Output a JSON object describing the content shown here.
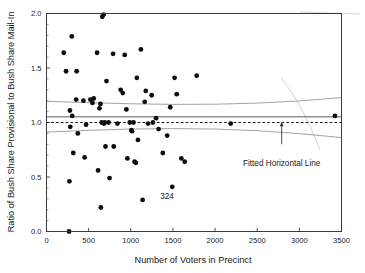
{
  "chart_data": {
    "type": "scatter",
    "title": "",
    "xlabel": "Number of Voters in Precinct",
    "ylabel": "Ratio of Bush Share Provisional to Bush Share Mail-In",
    "xlim": [
      0,
      3500
    ],
    "ylim": [
      0.0,
      2.0
    ],
    "xticks": [
      0,
      500,
      1000,
      1500,
      2000,
      2500,
      3000,
      3500
    ],
    "xtick_labels": [
      "0",
      "500",
      "1000",
      "1500",
      "2000",
      "2500",
      "3000",
      "3500"
    ],
    "yticks": [
      0.0,
      0.5,
      1.0,
      1.5,
      2.0
    ],
    "ytick_labels": [
      "0.0",
      "0.5",
      "1.0",
      "1.5",
      "2.0"
    ],
    "y_minor_ticks": [
      0.1,
      0.2,
      0.3,
      0.4,
      0.6,
      0.7,
      0.8,
      0.9,
      1.1,
      1.2,
      1.3,
      1.4,
      1.6,
      1.7,
      1.8,
      1.9
    ],
    "grid": false,
    "legend": false,
    "marker": "filled-circle",
    "marker_color": "#0d0d0d",
    "marker_size": 4.4,
    "points": [
      [
        205,
        1.64
      ],
      [
        232,
        1.47
      ],
      [
        268,
        0.0
      ],
      [
        272,
        0.46
      ],
      [
        278,
        1.11
      ],
      [
        282,
        0.96
      ],
      [
        300,
        1.79
      ],
      [
        305,
        1.06
      ],
      [
        318,
        0.72
      ],
      [
        352,
        1.21
      ],
      [
        358,
        1.47
      ],
      [
        372,
        0.9
      ],
      [
        438,
        1.2
      ],
      [
        452,
        0.68
      ],
      [
        470,
        0.98
      ],
      [
        520,
        1.21
      ],
      [
        545,
        1.18
      ],
      [
        560,
        1.22
      ],
      [
        600,
        1.64
      ],
      [
        612,
        0.56
      ],
      [
        628,
        1.13
      ],
      [
        640,
        1.17
      ],
      [
        645,
        0.22
      ],
      [
        655,
        1.0
      ],
      [
        662,
        1.97
      ],
      [
        678,
        1.99
      ],
      [
        682,
        0.99
      ],
      [
        690,
        1.0
      ],
      [
        700,
        0.78
      ],
      [
        712,
        1.38
      ],
      [
        736,
        1.0
      ],
      [
        748,
        0.49
      ],
      [
        790,
        1.63
      ],
      [
        798,
        0.78
      ],
      [
        842,
        0.99
      ],
      [
        880,
        1.3
      ],
      [
        905,
        1.27
      ],
      [
        928,
        1.62
      ],
      [
        948,
        1.12
      ],
      [
        960,
        0.67
      ],
      [
        988,
        1.0
      ],
      [
        1008,
        0.93
      ],
      [
        1015,
        0.92
      ],
      [
        1032,
        1.0
      ],
      [
        1045,
        0.64
      ],
      [
        1060,
        0.63
      ],
      [
        1072,
        1.41
      ],
      [
        1085,
        0.84
      ],
      [
        1120,
        1.67
      ],
      [
        1140,
        0.29
      ],
      [
        1165,
        1.19
      ],
      [
        1178,
        1.29
      ],
      [
        1205,
        0.99
      ],
      [
        1248,
        1.25
      ],
      [
        1262,
        1.0
      ],
      [
        1300,
        1.04
      ],
      [
        1330,
        0.94
      ],
      [
        1380,
        0.72
      ],
      [
        1432,
        0.88
      ],
      [
        1468,
        1.14
      ],
      [
        1492,
        0.41
      ],
      [
        1520,
        1.41
      ],
      [
        1545,
        1.26
      ],
      [
        1600,
        0.67
      ],
      [
        1640,
        0.64
      ],
      [
        1782,
        1.43
      ],
      [
        2185,
        0.99
      ],
      [
        3422,
        1.06
      ]
    ],
    "point_annotations": [
      {
        "label": "324",
        "x": 1492,
        "y": 0.41,
        "label_x": 1430,
        "label_y": 0.3
      }
    ],
    "reference_line": {
      "label": "",
      "y": 1.0,
      "style": "dashed",
      "color": "#121212"
    },
    "fitted_line": {
      "label": "Fitted Horizontal Line",
      "y": 1.052,
      "style": "solid",
      "color": "#4a4a4a"
    },
    "confidence_bands": {
      "upper": [
        [
          0,
          1.195
        ],
        [
          500,
          1.182
        ],
        [
          1000,
          1.172
        ],
        [
          1500,
          1.166
        ],
        [
          2000,
          1.168
        ],
        [
          2500,
          1.178
        ],
        [
          3000,
          1.198
        ],
        [
          3500,
          1.228
        ]
      ],
      "lower": [
        [
          0,
          0.912
        ],
        [
          500,
          0.928
        ],
        [
          1000,
          0.94
        ],
        [
          1500,
          0.944
        ],
        [
          2000,
          0.94
        ],
        [
          2500,
          0.925
        ],
        [
          3000,
          0.898
        ],
        [
          3500,
          0.862
        ]
      ],
      "color": "#8c8c8c"
    },
    "annotations": [
      {
        "text": "Fitted Horizontal Line",
        "text_x": 2790,
        "text_y": 0.6,
        "arrow_from": [
          2790,
          0.8
        ],
        "arrow_to": [
          2790,
          1.005
        ]
      }
    ]
  }
}
